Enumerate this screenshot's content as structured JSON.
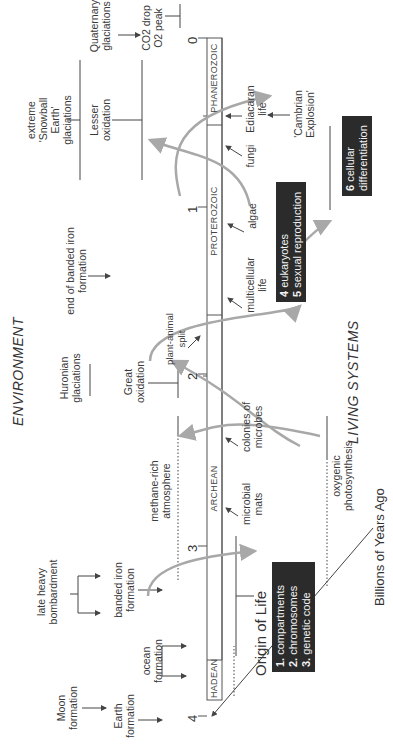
{
  "headings": {
    "environment": "ENVIRONMENT",
    "living_systems": "LIVING SYSTEMS"
  },
  "axis": {
    "label": "Billions of Years Ago",
    "ticks": [
      "0",
      "1",
      "2",
      "3",
      "4"
    ]
  },
  "eons": [
    "PHANEROZOIC",
    "PROTEROZOIC",
    "ARCHEAN",
    "HADEAN"
  ],
  "environment_events": {
    "quaternary": "Quaternary glaciations",
    "co2_drop": "CO2 drop",
    "o2_peak": "O2 peak",
    "snowball": "extreme 'Snowball Earth' glaciations",
    "lesser_oxidation": "Lesser oxidation",
    "end_banded_iron": "end of banded iron formation",
    "huronian": "Huronian glaciations",
    "great_oxidation": "Great oxidation",
    "methane": "methane-rich atmosphere",
    "late_heavy": "late heavy bombardment",
    "banded_iron": "banded iron formation",
    "moon": "Moon formation",
    "earth": "Earth formation",
    "ocean": "ocean formation"
  },
  "life_events": {
    "ediacaran": "Ediacaran life",
    "fungi": "fungi",
    "cambrian": "'Cambrian Explosion'",
    "algae": "algae",
    "multicellular": "multicellular life",
    "plant_animal": "plant-animal split",
    "colonies": "colonies of microbes",
    "microbial_mats": "microbial mats",
    "oxygenic": "oxygenic photosynthesis"
  },
  "boxes": {
    "origin_title": "Origin of Life",
    "origin_items": [
      {
        "num": "1.",
        "label": "compartments"
      },
      {
        "num": "2.",
        "label": "chromosomes"
      },
      {
        "num": "3.",
        "label": "genetic code"
      }
    ],
    "euk_items": [
      {
        "num": "4",
        "label": "eukaryotes"
      },
      {
        "num": "5",
        "label": "sexual reproduction"
      }
    ],
    "cell_item": {
      "num": "6",
      "label": "cellular differentiation"
    }
  },
  "colors": {
    "line": "#444444",
    "arrow_gray": "#a8a8a8",
    "box_dark": "#2b2b2b"
  }
}
